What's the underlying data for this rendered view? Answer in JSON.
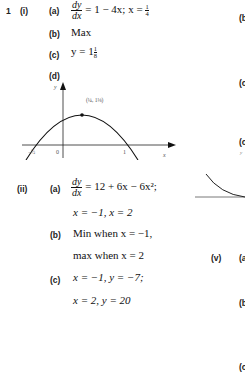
{
  "question": {
    "number": "1",
    "parts": [
      {
        "label": "(i)",
        "items": [
          {
            "label": "(a)",
            "deriv_num": "dy",
            "deriv_den": "dx",
            "rhs": "= 1 − 4x; x = ",
            "frac_n": "1",
            "frac_d": "4"
          },
          {
            "label": "(b)",
            "text": "Max"
          },
          {
            "label": "(c)",
            "text": "y = 1",
            "frac_n": "1",
            "frac_d": "8"
          },
          {
            "label": "(d)",
            "graph": {
              "y_axis_label": "y",
              "x_axis_label": "x",
              "origin_label": "0",
              "x_root_left": "−1/2",
              "x_root_right": "1",
              "max_point_label": "(1/4, 1 1/8)"
            }
          }
        ]
      },
      {
        "label": "(ii)",
        "items": [
          {
            "label": "(a)",
            "deriv_num": "dy",
            "deriv_den": "dx",
            "rhs": "= 12 + 6x − 6x²;",
            "line2": "x = −1, x = 2"
          },
          {
            "label": "(b)",
            "text": "Min when x = −1,",
            "line2": "max when x = 2"
          },
          {
            "label": "(c)",
            "text": "x = −1, y = −7;",
            "line2": "x = 2, y = 20"
          }
        ]
      }
    ]
  },
  "right_column": {
    "labels": [
      "(b",
      "(c",
      "(c",
      "(v)",
      "(a",
      "(b",
      "(c"
    ],
    "graph_y_label": "y"
  }
}
